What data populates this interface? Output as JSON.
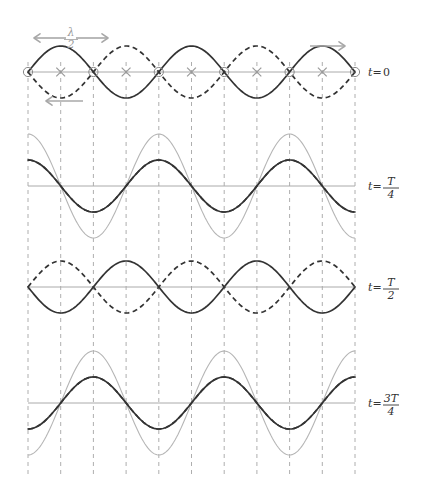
{
  "figure": {
    "wavelength_label": {
      "numerator": "λ",
      "denominator": "2",
      "left_arrow": "←",
      "right_arrow": "→"
    },
    "direction_arrows": {
      "right_label": "→",
      "left_label": "←"
    },
    "time_labels": [
      {
        "prefix": "t",
        "eq": "=",
        "value": "0",
        "numerator": "",
        "denominator": ""
      },
      {
        "prefix": "t",
        "eq": "=",
        "value": "",
        "numerator": "T",
        "denominator": "4"
      },
      {
        "prefix": "t",
        "eq": "=",
        "value": "",
        "numerator": "T",
        "denominator": "2"
      },
      {
        "prefix": "t",
        "eq": "=",
        "value": "",
        "numerator": "3T",
        "denominator": "4"
      }
    ]
  },
  "colors": {
    "wave_right": "#333333",
    "wave_left": "#333333",
    "resultant": "#b5b5b5",
    "axis": "#aaaaaa",
    "gridline": "#999999",
    "node_marker": "#888888",
    "antinode_marker": "#999999",
    "arrow": "#a8a8a8",
    "text": "#333333"
  },
  "chart_data": {
    "type": "line",
    "xlabel": "",
    "ylabel": "",
    "x_range": [
      0,
      2.5
    ],
    "x_unit": "wavelengths",
    "amplitude": 1,
    "grid": true,
    "grid_spacing_quarter_wavelength": true,
    "node_count": 6,
    "antinode_count": 5,
    "panels": [
      {
        "time_label": "t=0",
        "phase_fraction": 0,
        "series": [
          {
            "name": "rightward wave",
            "style": "solid",
            "color": "#333333",
            "amplitude": 1,
            "phase_deg": 0,
            "visible": true
          },
          {
            "name": "leftward wave",
            "style": "dashed",
            "color": "#333333",
            "amplitude": 1,
            "phase_deg": 180,
            "visible": true
          },
          {
            "name": "resultant",
            "style": "solid",
            "color": "#b5b5b5",
            "amplitude": 0,
            "phase_deg": 0,
            "visible": false
          }
        ],
        "markers": {
          "nodes": true,
          "antinodes": true
        },
        "annotations": [
          "lambda/2",
          "right-arrow",
          "left-arrow"
        ]
      },
      {
        "time_label": "t=T/4",
        "phase_fraction": 0.25,
        "series": [
          {
            "name": "rightward wave",
            "style": "solid",
            "color": "#333333",
            "amplitude": 1,
            "phase_deg": 90,
            "visible": true
          },
          {
            "name": "leftward wave",
            "style": "dashed",
            "color": "#333333",
            "amplitude": 1,
            "phase_deg": 90,
            "visible": true
          },
          {
            "name": "resultant",
            "style": "solid",
            "color": "#b5b5b5",
            "amplitude": 2,
            "phase_deg": 90,
            "visible": true
          }
        ],
        "markers": {
          "nodes": false,
          "antinodes": false
        },
        "annotations": []
      },
      {
        "time_label": "t=T/2",
        "phase_fraction": 0.5,
        "series": [
          {
            "name": "rightward wave",
            "style": "solid",
            "color": "#333333",
            "amplitude": 1,
            "phase_deg": 180,
            "visible": true
          },
          {
            "name": "leftward wave",
            "style": "dashed",
            "color": "#333333",
            "amplitude": 1,
            "phase_deg": 0,
            "visible": true
          },
          {
            "name": "resultant",
            "style": "solid",
            "color": "#b5b5b5",
            "amplitude": 0,
            "phase_deg": 0,
            "visible": false
          }
        ],
        "markers": {
          "nodes": false,
          "antinodes": false
        },
        "annotations": []
      },
      {
        "time_label": "t=3T/4",
        "phase_fraction": 0.75,
        "series": [
          {
            "name": "rightward wave",
            "style": "solid",
            "color": "#333333",
            "amplitude": 1,
            "phase_deg": 270,
            "visible": true
          },
          {
            "name": "leftward wave",
            "style": "dashed",
            "color": "#333333",
            "amplitude": 1,
            "phase_deg": 270,
            "visible": true
          },
          {
            "name": "resultant",
            "style": "solid",
            "color": "#b5b5b5",
            "amplitude": 2,
            "phase_deg": 270,
            "visible": true
          }
        ],
        "markers": {
          "nodes": false,
          "antinodes": false
        },
        "annotations": []
      }
    ]
  }
}
